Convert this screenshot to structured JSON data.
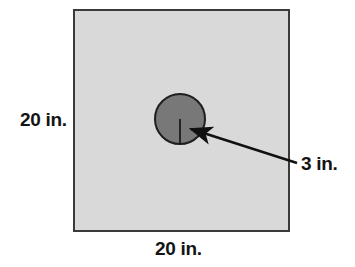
{
  "figure": {
    "shapes": {
      "square": {
        "name": "outer-square",
        "fill_color": "#d9d9d9",
        "stroke_color": "#3a3a3a",
        "stroke_width": 2,
        "x": 73,
        "y": 9,
        "width": 217,
        "height": 223,
        "side_length_label": "20 in."
      },
      "circle": {
        "name": "inner-circle",
        "fill_color": "#787878",
        "stroke_color": "#1e1e1e",
        "stroke_width": 2,
        "cx": 180,
        "cy": 119,
        "r": 25,
        "radius_label": "3 in."
      },
      "radius_line": {
        "name": "radius-segment",
        "color": "#101010",
        "x1": 180,
        "y1": 119,
        "x2": 180,
        "y2": 144
      },
      "leader_arrow": {
        "name": "radius-leader-arrow",
        "color": "#101010",
        "tail_x": 297,
        "tail_y": 163,
        "tip_x": 188,
        "tip_y": 127
      }
    },
    "labels": {
      "left_side": "20 in.",
      "bottom_side": "20 in.",
      "radius": "3 in."
    }
  }
}
